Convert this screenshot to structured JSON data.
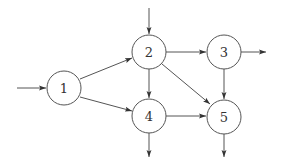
{
  "diagram": {
    "type": "directed-graph",
    "width": 281,
    "height": 165,
    "stroke_color": "#555555",
    "node_radius": 17,
    "nodes": [
      {
        "id": "1",
        "label": "1",
        "x": 64,
        "y": 88
      },
      {
        "id": "2",
        "label": "2",
        "x": 149,
        "y": 52
      },
      {
        "id": "3",
        "label": "3",
        "x": 224,
        "y": 52
      },
      {
        "id": "4",
        "label": "4",
        "x": 149,
        "y": 116
      },
      {
        "id": "5",
        "label": "5",
        "x": 224,
        "y": 117
      }
    ],
    "edges": [
      {
        "from": "in",
        "to": "1",
        "x1": 17,
        "y1": 88,
        "x2": 46,
        "y2": 88
      },
      {
        "from": "in",
        "to": "2",
        "x1": 149,
        "y1": 8,
        "x2": 149,
        "y2": 34
      },
      {
        "from": "1",
        "to": "2",
        "x1": 80,
        "y1": 79,
        "x2": 132,
        "y2": 58
      },
      {
        "from": "1",
        "to": "4",
        "x1": 80,
        "y1": 97,
        "x2": 132,
        "y2": 111
      },
      {
        "from": "2",
        "to": "3",
        "x1": 166,
        "y1": 52,
        "x2": 206,
        "y2": 52
      },
      {
        "from": "2",
        "to": "4",
        "x1": 149,
        "y1": 69,
        "x2": 149,
        "y2": 98
      },
      {
        "from": "2",
        "to": "5",
        "x1": 162,
        "y1": 64,
        "x2": 210,
        "y2": 104
      },
      {
        "from": "3",
        "to": "out",
        "x1": 241,
        "y1": 52,
        "x2": 266,
        "y2": 52
      },
      {
        "from": "3",
        "to": "5",
        "x1": 224,
        "y1": 69,
        "x2": 224,
        "y2": 99
      },
      {
        "from": "4",
        "to": "5",
        "x1": 166,
        "y1": 116,
        "x2": 206,
        "y2": 116
      },
      {
        "from": "4",
        "to": "out",
        "x1": 149,
        "y1": 133,
        "x2": 149,
        "y2": 157
      },
      {
        "from": "5",
        "to": "out",
        "x1": 224,
        "y1": 134,
        "x2": 224,
        "y2": 157
      }
    ]
  }
}
